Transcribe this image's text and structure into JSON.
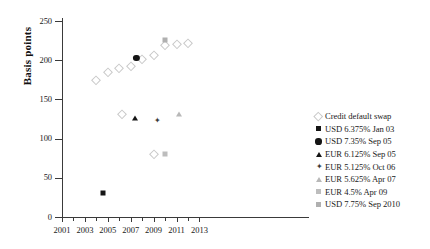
{
  "chart_data": {
    "type": "scatter",
    "title": "",
    "xlabel": "",
    "ylabel": "Basis points",
    "xlim": [
      2001,
      2013.7
    ],
    "ylim": [
      0,
      250
    ],
    "grid": false,
    "legend_position": "right",
    "y_ticks": [
      0,
      50,
      100,
      150,
      200,
      250
    ],
    "x_ticks_major": [
      2001,
      2003,
      2005,
      2007,
      2009,
      2011,
      2013
    ],
    "x_ticks_minor": [
      2002,
      2004,
      2006,
      2008,
      2010,
      2012
    ],
    "series": [
      {
        "name": "Credit default swap",
        "marker": "diamond-open",
        "color": "#c9c9c9",
        "points": [
          {
            "x": 2004.0,
            "y": 175
          },
          {
            "x": 2005.0,
            "y": 185
          },
          {
            "x": 2006.0,
            "y": 190
          },
          {
            "x": 2007.0,
            "y": 192
          },
          {
            "x": 2008.0,
            "y": 201
          },
          {
            "x": 2009.0,
            "y": 207
          },
          {
            "x": 2010.0,
            "y": 220
          },
          {
            "x": 2011.0,
            "y": 221
          },
          {
            "x": 2012.0,
            "y": 222
          },
          {
            "x": 2006.2,
            "y": 131
          },
          {
            "x": 2009.0,
            "y": 80
          }
        ]
      },
      {
        "name": "USD 6.375% Jan 03",
        "marker": "square-filled",
        "color": "#151515",
        "points": [
          {
            "x": 2004.6,
            "y": 30
          }
        ]
      },
      {
        "name": "USD 7.35% Sep 05",
        "marker": "circle-filled",
        "color": "#151515",
        "points": [
          {
            "x": 2007.5,
            "y": 203
          }
        ]
      },
      {
        "name": "EUR 6.125% Sep 05",
        "marker": "triangle-filled",
        "color": "#151515",
        "points": [
          {
            "x": 2007.4,
            "y": 126
          }
        ]
      },
      {
        "name": "EUR 5.125% Oct 06",
        "marker": "star4",
        "color": "#3a3a3a",
        "points": [
          {
            "x": 2009.3,
            "y": 122
          }
        ]
      },
      {
        "name": "EUR 5.625% Apr 07",
        "marker": "triangle-gray",
        "color": "#b8b8b8",
        "points": [
          {
            "x": 2011.2,
            "y": 131
          }
        ]
      },
      {
        "name": "EUR 4.5% Apr 09",
        "marker": "square-gray",
        "color": "#bdbdbd",
        "points": [
          {
            "x": 2010.0,
            "y": 80
          }
        ]
      },
      {
        "name": "USD 7.75% Sep 2010",
        "marker": "square-gray2",
        "color": "#b0b0b0",
        "points": [
          {
            "x": 2010.0,
            "y": 226
          }
        ]
      }
    ],
    "legend": [
      {
        "label": "Credit default swap",
        "marker": "diamond-open"
      },
      {
        "label": "USD 6.375% Jan 03",
        "marker": "square-filled"
      },
      {
        "label": "USD 7.35% Sep 05",
        "marker": "circle-filled"
      },
      {
        "label": "EUR 6.125% Sep 05",
        "marker": "triangle-filled"
      },
      {
        "label": "EUR 5.125% Oct 06",
        "marker": "star4"
      },
      {
        "label": "EUR 5.625% Apr 07",
        "marker": "triangle-gray"
      },
      {
        "label": "EUR 4.5% Apr 09",
        "marker": "square-gray"
      },
      {
        "label": "USD 7.75% Sep 2010",
        "marker": "square-gray2"
      }
    ]
  }
}
